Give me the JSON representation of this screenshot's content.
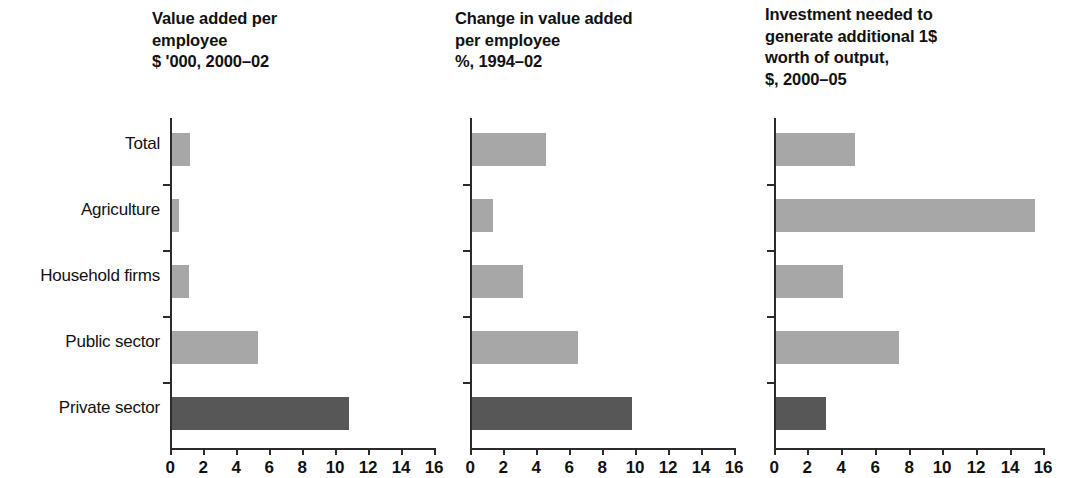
{
  "chart_data": {
    "type": "bar",
    "orientation": "horizontal",
    "title": "",
    "categories": [
      "Total",
      "Agriculture",
      "Household firms",
      "Public sector",
      "Private sector"
    ],
    "highlight_category": "Private sector",
    "colors": {
      "bar_light": "#a7a7a7",
      "bar_dark": "#575757",
      "axis": "#2b2b2b",
      "text": "#111111"
    },
    "xlim": [
      0,
      16
    ],
    "xticks": [
      0,
      2,
      4,
      6,
      8,
      10,
      12,
      14,
      16
    ],
    "xticklabels": [
      "0",
      "2",
      "4",
      "6",
      "8",
      "10",
      "12",
      "14",
      "16"
    ],
    "grid": false,
    "legend": "none",
    "panels": [
      {
        "title": "Value added per\nemployee\n$ '000, 2000–02",
        "title_line1": "Value added per",
        "title_line2": "employee",
        "title_line3": "$ '000, 2000–02",
        "xlabel": "",
        "ylabel": "",
        "values": [
          1.1,
          0.4,
          1.0,
          5.2,
          10.7
        ]
      },
      {
        "title": "Change in value added\nper employee\n%, 1994–02",
        "title_line1": "Change in value added",
        "title_line2": "per employee",
        "title_line3": "%, 1994–02",
        "xlabel": "",
        "ylabel": "",
        "values": [
          4.5,
          1.3,
          3.1,
          6.4,
          9.7
        ]
      },
      {
        "title": "Investment needed to\ngenerate additional 1$\nworth of output,\n$, 2000–05",
        "title_line1": "Investment needed to",
        "title_line2": "generate additional 1$",
        "title_line3": "worth of output,",
        "title_line4": "$, 2000–05",
        "xlabel": "",
        "ylabel": "",
        "values": [
          4.7,
          15.4,
          4.0,
          7.3,
          3.0
        ]
      }
    ]
  }
}
